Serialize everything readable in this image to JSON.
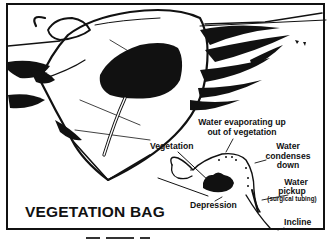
{
  "figure": {
    "title": "VEGETATION BAG",
    "labels": {
      "evaporating_line1": "Water evaporating up",
      "evaporating_line2": "out of vegetation",
      "vegetation": "Vegetation",
      "condenses_line1": "Water",
      "condenses_line2": "condenses",
      "condenses_line3": "down",
      "pickup_line1": "Water",
      "pickup_line2": "pickup",
      "pickup_line3": "(surgical tubing)",
      "depression": "Depression",
      "incline": "Incline"
    },
    "colors": {
      "ink": "#111111",
      "paper": "#ffffff"
    }
  }
}
